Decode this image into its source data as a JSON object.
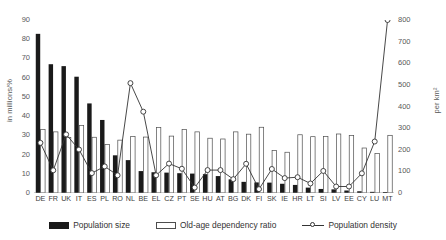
{
  "chart_data": {
    "type": "bar",
    "title": "",
    "subtitle": "",
    "categories": [
      "DE",
      "FR",
      "UK",
      "IT",
      "ES",
      "PL",
      "RO",
      "NL",
      "BE",
      "EL",
      "CZ",
      "PT",
      "SE",
      "HU",
      "AT",
      "BG",
      "DK",
      "FI",
      "SK",
      "IE",
      "HR",
      "LT",
      "SI",
      "LV",
      "EE",
      "CY",
      "LU",
      "MT"
    ],
    "series": [
      {
        "name": "Population size",
        "axis": "left",
        "unit": "millions",
        "values": [
          82.8,
          67.0,
          66.0,
          60.5,
          46.6,
          38.0,
          19.6,
          17.1,
          11.4,
          10.8,
          10.6,
          10.3,
          10.1,
          9.8,
          8.8,
          7.1,
          5.8,
          5.5,
          5.4,
          4.8,
          4.2,
          2.8,
          2.1,
          1.9,
          1.3,
          0.9,
          0.6,
          0.5
        ]
      },
      {
        "name": "Old-age dependency ratio",
        "axis": "left",
        "unit": "%",
        "values": [
          33.1,
          31.8,
          28.9,
          35.2,
          29.0,
          25.3,
          27.5,
          29.4,
          29.1,
          34.0,
          29.6,
          33.0,
          31.8,
          28.5,
          28.1,
          31.8,
          30.6,
          34.2,
          22.1,
          21.2,
          30.3,
          29.3,
          29.4,
          30.7,
          29.9,
          23.4,
          20.5,
          30.0
        ]
      },
      {
        "name": "Population density",
        "axis": "right",
        "unit": "per km²",
        "values": [
          232,
          105,
          271,
          201,
          92,
          123,
          82,
          508,
          376,
          82,
          136,
          112,
          25,
          106,
          106,
          64,
          135,
          18,
          111,
          69,
          73,
          44,
          102,
          30,
          30,
          91,
          238,
          800
        ]
      }
    ],
    "y_left": {
      "label": "in millions/%",
      "min": 0,
      "max": 90,
      "step": 10,
      "ticks": [
        "0",
        "10",
        "20",
        "30",
        "40",
        "50",
        "60",
        "70",
        "80",
        "90"
      ]
    },
    "y_right": {
      "label": "per km²",
      "min": 0,
      "max": 800,
      "step": 100,
      "ticks": [
        "0",
        "100",
        "200",
        "300",
        "400",
        "500",
        "600",
        "700",
        "800"
      ]
    },
    "xlabel": "",
    "grid": false,
    "legend_position": "bottom"
  },
  "legend": {
    "items": [
      {
        "label": "Population size",
        "marker": "filled-bar-swatch",
        "color": "#1a1a1a"
      },
      {
        "label": "Old-age dependency ratio",
        "marker": "outline-bar-swatch",
        "color": "#ffffff"
      },
      {
        "label": "Population density",
        "marker": "line-circle-swatch",
        "color": "#333333"
      }
    ]
  },
  "colors": {
    "population_size_bar": "#1a1a1a",
    "dependency_bar_fill": "#ffffff",
    "dependency_bar_stroke": "#4d4d4d",
    "density_line": "#333333",
    "axis": "#8c8c8c",
    "text": "#595959",
    "background": "#ffffff"
  }
}
